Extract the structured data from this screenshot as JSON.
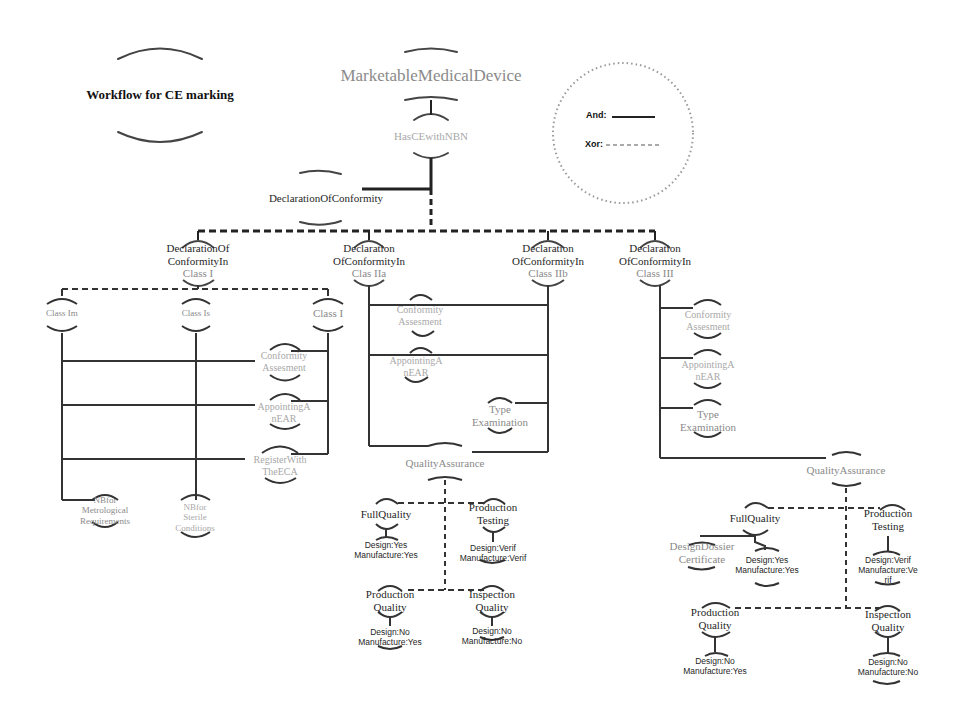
{
  "diagram": {
    "title": "Workflow for CE marking",
    "legend": {
      "and_label": "And:",
      "xor_label": "Xor:",
      "and_style": "solid",
      "xor_style": "dashed"
    },
    "root": {
      "label": "MarketableMedicalDevice",
      "child": "HasCEwithNBN"
    },
    "declaration": "DeclarationOfConformity",
    "classes": {
      "class_i": {
        "label_l1": "DeclarationOf",
        "label_l2": "ConformityIn",
        "label_l3": "Class I",
        "sub": [
          "Class Im",
          "Class Is",
          "Class I"
        ],
        "steps": [
          "Conformity Assesment",
          "AppointingA nEAR",
          "RegisterWith TheECA"
        ],
        "nb_metrological": [
          "NBfor",
          "Metrological",
          "Requirements"
        ],
        "nb_sterile": [
          "NBfor",
          "Sterile",
          "Conditions"
        ]
      },
      "class_iia": {
        "label_l1": "Declaration",
        "label_l2": "OfConformityIn",
        "label_l3": "Clas IIa",
        "steps": [
          "Conformity Assesment",
          "AppointingA nEAR"
        ]
      },
      "class_iib": {
        "label_l1": "Declaration",
        "label_l2": "OfConformityIn",
        "label_l3": "Class IIb",
        "steps": [
          "Type Examination"
        ]
      },
      "class_iii": {
        "label_l1": "Declaration",
        "label_l2": "OfConformityIn",
        "label_l3": "Class III",
        "steps": [
          "Conformity Assesment",
          "AppointingA nEAR",
          "Type Examination"
        ]
      }
    },
    "qa_left": {
      "label": "QualityAssurance",
      "full_quality": {
        "label": "FullQuality",
        "design": "Design:Yes",
        "manufacture": "Manufacture:Yes"
      },
      "production_testing": {
        "label_l1": "Production",
        "label_l2": "Testing",
        "design": "Design:Verif",
        "manufacture": "Manufacture:Verif"
      },
      "production_quality": {
        "label_l1": "Production",
        "label_l2": "Quality",
        "design": "Design:No",
        "manufacture": "Manufacture:Yes"
      },
      "inspection_quality": {
        "label_l1": "Inspection",
        "label_l2": "Quality",
        "design": "Design:No",
        "manufacture": "Manufacture:No"
      }
    },
    "qa_right": {
      "label": "QualityAssurance",
      "full_quality": {
        "label": "FullQuality",
        "design": "Design:Yes",
        "manufacture": "Manufacture:Yes"
      },
      "design_dossier": {
        "label_l1": "DesignDossier",
        "label_l2": "Certificate"
      },
      "production_testing": {
        "label_l1": "Production",
        "label_l2": "Testing",
        "design": "Design:Verif",
        "manufacture_l1": "Manufacture:Ve",
        "manufacture_l2": "rif"
      },
      "production_quality": {
        "label_l1": "Production",
        "label_l2": "Quality",
        "design": "Design:No",
        "manufacture": "Manufacture:Yes"
      },
      "inspection_quality": {
        "label_l1": "Inspection",
        "label_l2": "Quality",
        "design": "Design:No",
        "manufacture": "Manufacture:No"
      }
    },
    "colors": {
      "line": "#333333",
      "dark_text": "#1f1f1f",
      "grey_text": "#8a8a8a"
    }
  }
}
